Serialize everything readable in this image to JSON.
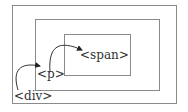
{
  "diagram": {
    "boxes": [
      {
        "id": "div",
        "label": "<div>"
      },
      {
        "id": "p",
        "label": "<p>"
      },
      {
        "id": "span",
        "label": "<span>"
      }
    ],
    "arrows": [
      {
        "from": "div",
        "to": "p"
      },
      {
        "from": "p",
        "to": "span"
      }
    ],
    "colors": {
      "border": "#8a8a8a",
      "arrow": "#222222"
    }
  }
}
